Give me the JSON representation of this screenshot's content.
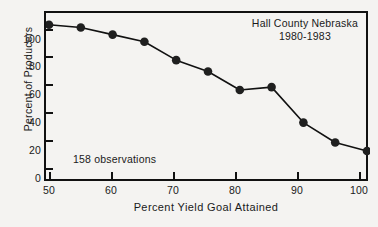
{
  "chart_data": {
    "type": "line",
    "title": "Hall County Nebraska",
    "subtitle": "1980-1983",
    "annotation": "158 observations",
    "xlabel": "Percent Yield Goal Attained",
    "ylabel": "Percent of Producers",
    "xlim": [
      50,
      100
    ],
    "ylim": [
      0,
      105
    ],
    "xticks": [
      50,
      60,
      70,
      80,
      90,
      100
    ],
    "yticks": [
      0,
      20,
      40,
      60,
      80,
      100
    ],
    "grid": false,
    "legend": false,
    "marker": "filled-circle",
    "line_color": "#111111",
    "marker_color": "#1f1f1f",
    "x": [
      50,
      55,
      60,
      65,
      70,
      75,
      80,
      85,
      90,
      95,
      100
    ],
    "values": [
      101,
      99,
      94,
      89,
      76,
      68,
      55,
      57,
      32,
      18,
      12
    ],
    "series": [
      {
        "name": "Percent of Producers",
        "x": [
          50,
          55,
          60,
          65,
          70,
          75,
          80,
          85,
          90,
          95,
          100
        ],
        "values": [
          101,
          99,
          94,
          89,
          76,
          68,
          55,
          57,
          32,
          18,
          12
        ]
      }
    ]
  },
  "axes": {
    "y_tick_labels": [
      "100",
      "80",
      "60",
      "40",
      "20",
      "0"
    ],
    "x_tick_labels": [
      "50",
      "60",
      "70",
      "80",
      "90",
      "100"
    ],
    "y_title": "Percent of Producers",
    "x_title": "Percent Yield Goal Attained"
  },
  "labels": {
    "title_line1": "Hall County Nebraska",
    "title_line2": "1980-1983",
    "observations": "158 observations"
  }
}
